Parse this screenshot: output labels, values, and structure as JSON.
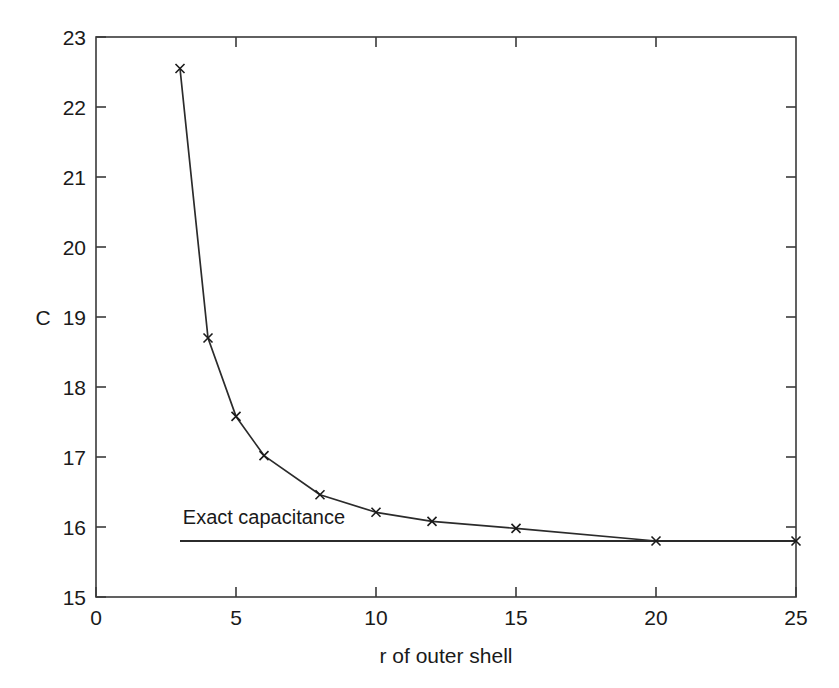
{
  "chart_data": {
    "type": "line",
    "title": "",
    "xlabel": "r of outer shell",
    "ylabel": "C",
    "xlim": [
      0,
      25
    ],
    "ylim": [
      15,
      23
    ],
    "xticks": [
      "0",
      "5",
      "10",
      "15",
      "20",
      "25"
    ],
    "xtick_values": [
      0,
      5,
      10,
      15,
      20,
      25
    ],
    "yticks": [
      "15",
      "16",
      "17",
      "18",
      "19",
      "20",
      "21",
      "22",
      "23"
    ],
    "ytick_values": [
      15,
      16,
      17,
      18,
      19,
      20,
      21,
      22,
      23
    ],
    "grid": false,
    "legend": "none",
    "marker": "x",
    "series": [
      {
        "name": "Computed capacitance",
        "x": [
          3,
          4,
          5,
          6,
          8,
          10,
          12,
          15,
          20,
          25
        ],
        "values": [
          22.55,
          18.7,
          17.58,
          17.02,
          16.46,
          16.21,
          16.08,
          15.98,
          15.8,
          15.8
        ]
      }
    ],
    "reference_line": {
      "label": "Exact capacitance",
      "value": 15.8,
      "x_start": 3,
      "x_end": 25,
      "label_x": 3.1,
      "label_y": 16.05
    },
    "colors": {
      "line": "#2b2b2b",
      "axis": "#3a3a3a",
      "text": "#1a1a1a",
      "background": "#ffffff"
    }
  },
  "caption": {
    "cropped_text": ""
  }
}
